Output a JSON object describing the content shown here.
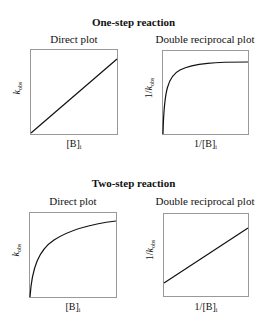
{
  "sections": [
    {
      "title": "One-step reaction",
      "plots": [
        {
          "title": "Direct plot",
          "xlabel": {
            "main": "[B]",
            "sub": "i"
          },
          "ylabel": {
            "prefix": "",
            "italic": "k",
            "sub": "obs"
          },
          "curve": "linear"
        },
        {
          "title": "Double reciprocal plot",
          "xlabel": {
            "main": "1/[B]",
            "sub": "i"
          },
          "ylabel": {
            "prefix": "1/",
            "italic": "k",
            "sub": "obs"
          },
          "curve": "hyperbolic"
        }
      ]
    },
    {
      "title": "Two-step reaction",
      "plots": [
        {
          "title": "Direct plot",
          "xlabel": {
            "main": "[B]",
            "sub": "i"
          },
          "ylabel": {
            "prefix": "",
            "italic": "k",
            "sub": "obs"
          },
          "curve": "hyperbolic"
        },
        {
          "title": "Double reciprocal plot",
          "xlabel": {
            "main": "1/[B]",
            "sub": "i"
          },
          "ylabel": {
            "prefix": "1/",
            "italic": "k",
            "sub": "obs"
          },
          "curve": "linear"
        }
      ]
    }
  ],
  "colors": {
    "axis_box": "#999999",
    "curve": "#111111",
    "text": "#111111"
  }
}
